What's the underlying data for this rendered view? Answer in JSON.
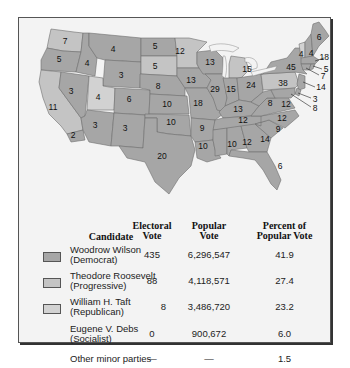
{
  "map": {
    "title": "Election of 1912 electoral map",
    "legend_colors": {
      "democrat": "#a6a6a6",
      "progressive": "#c4c4c4",
      "republican": "#d2d2d2"
    },
    "states": [
      {
        "name": "Washington",
        "votes": "7",
        "party": "progressive"
      },
      {
        "name": "Oregon",
        "votes": "5",
        "party": "democrat"
      },
      {
        "name": "California",
        "votes": "11",
        "party": "progressive"
      },
      {
        "name": "California-dem",
        "votes": "2",
        "party": "democrat"
      },
      {
        "name": "Idaho",
        "votes": "4",
        "party": "democrat"
      },
      {
        "name": "Nevada",
        "votes": "3",
        "party": "democrat"
      },
      {
        "name": "Montana",
        "votes": "4",
        "party": "democrat"
      },
      {
        "name": "Wyoming",
        "votes": "3",
        "party": "democrat"
      },
      {
        "name": "Utah",
        "votes": "4",
        "party": "republican"
      },
      {
        "name": "Colorado",
        "votes": "6",
        "party": "democrat"
      },
      {
        "name": "Arizona",
        "votes": "3",
        "party": "democrat"
      },
      {
        "name": "New Mexico",
        "votes": "3",
        "party": "democrat"
      },
      {
        "name": "North Dakota",
        "votes": "5",
        "party": "democrat"
      },
      {
        "name": "South Dakota",
        "votes": "5",
        "party": "progressive"
      },
      {
        "name": "Nebraska",
        "votes": "8",
        "party": "democrat"
      },
      {
        "name": "Kansas",
        "votes": "10",
        "party": "democrat"
      },
      {
        "name": "Oklahoma",
        "votes": "10",
        "party": "democrat"
      },
      {
        "name": "Texas",
        "votes": "20",
        "party": "democrat"
      },
      {
        "name": "Minnesota",
        "votes": "12",
        "party": "progressive"
      },
      {
        "name": "Iowa",
        "votes": "13",
        "party": "democrat"
      },
      {
        "name": "Missouri",
        "votes": "18",
        "party": "democrat"
      },
      {
        "name": "Arkansas",
        "votes": "9",
        "party": "democrat"
      },
      {
        "name": "Louisiana",
        "votes": "10",
        "party": "democrat"
      },
      {
        "name": "Wisconsin",
        "votes": "13",
        "party": "democrat"
      },
      {
        "name": "Illinois",
        "votes": "29",
        "party": "democrat"
      },
      {
        "name": "Michigan",
        "votes": "15",
        "party": "progressive"
      },
      {
        "name": "Indiana",
        "votes": "15",
        "party": "democrat"
      },
      {
        "name": "Ohio",
        "votes": "24",
        "party": "democrat"
      },
      {
        "name": "Kentucky",
        "votes": "13",
        "party": "democrat"
      },
      {
        "name": "Tennessee",
        "votes": "12",
        "party": "democrat"
      },
      {
        "name": "Mississippi",
        "votes": "10",
        "party": "democrat"
      },
      {
        "name": "Alabama",
        "votes": "12",
        "party": "democrat"
      },
      {
        "name": "Georgia",
        "votes": "14",
        "party": "democrat"
      },
      {
        "name": "Florida",
        "votes": "6",
        "party": "democrat"
      },
      {
        "name": "South Carolina",
        "votes": "9",
        "party": "democrat"
      },
      {
        "name": "North Carolina",
        "votes": "12",
        "party": "democrat"
      },
      {
        "name": "Virginia",
        "votes": "12",
        "party": "democrat"
      },
      {
        "name": "West Virginia",
        "votes": "8",
        "party": "democrat"
      },
      {
        "name": "Pennsylvania",
        "votes": "38",
        "party": "progressive"
      },
      {
        "name": "New York",
        "votes": "45",
        "party": "democrat"
      },
      {
        "name": "Vermont",
        "votes": "4",
        "party": "republican"
      },
      {
        "name": "New Hampshire",
        "votes": "4",
        "party": "democrat"
      },
      {
        "name": "Maine",
        "votes": "6",
        "party": "democrat"
      },
      {
        "name": "Massachusetts",
        "votes": "18",
        "party": "democrat"
      },
      {
        "name": "Rhode Island",
        "votes": "5",
        "party": "democrat"
      },
      {
        "name": "Connecticut",
        "votes": "7",
        "party": "democrat"
      },
      {
        "name": "New Jersey",
        "votes": "14",
        "party": "democrat"
      },
      {
        "name": "Delaware",
        "votes": "3",
        "party": "democrat"
      },
      {
        "name": "Maryland",
        "votes": "8",
        "party": "democrat"
      }
    ]
  },
  "table": {
    "headers": {
      "candidate": "Candidate",
      "electoral_line1": "Electoral",
      "electoral_line2": "Vote",
      "popular_line1": "Popular",
      "popular_line2": "Vote",
      "percent_line1": "Percent of",
      "percent_line2": "Popular Vote"
    },
    "rows": [
      {
        "name": "Woodrow Wilson",
        "party": "(Democrat)",
        "electoral": "435",
        "popular": "6,296,547",
        "percent": "41.9",
        "swatch": "#a6a6a6"
      },
      {
        "name": "Theodore Roosevelt",
        "party": "(Progressive)",
        "electoral": "88",
        "popular": "4,118,571",
        "percent": "27.4",
        "swatch": "#c4c4c4"
      },
      {
        "name": "William H. Taft",
        "party": "(Republican)",
        "electoral": "8",
        "popular": "3,486,720",
        "percent": "23.2",
        "swatch": "#d2d2d2"
      },
      {
        "name": "Eugene V. Debs",
        "party": "(Socialist)",
        "electoral": "0",
        "popular": "900,672",
        "percent": "6.0"
      },
      {
        "name": "Other minor parties",
        "party": "",
        "electoral": "—",
        "popular": "—",
        "percent": "1.5"
      }
    ]
  }
}
